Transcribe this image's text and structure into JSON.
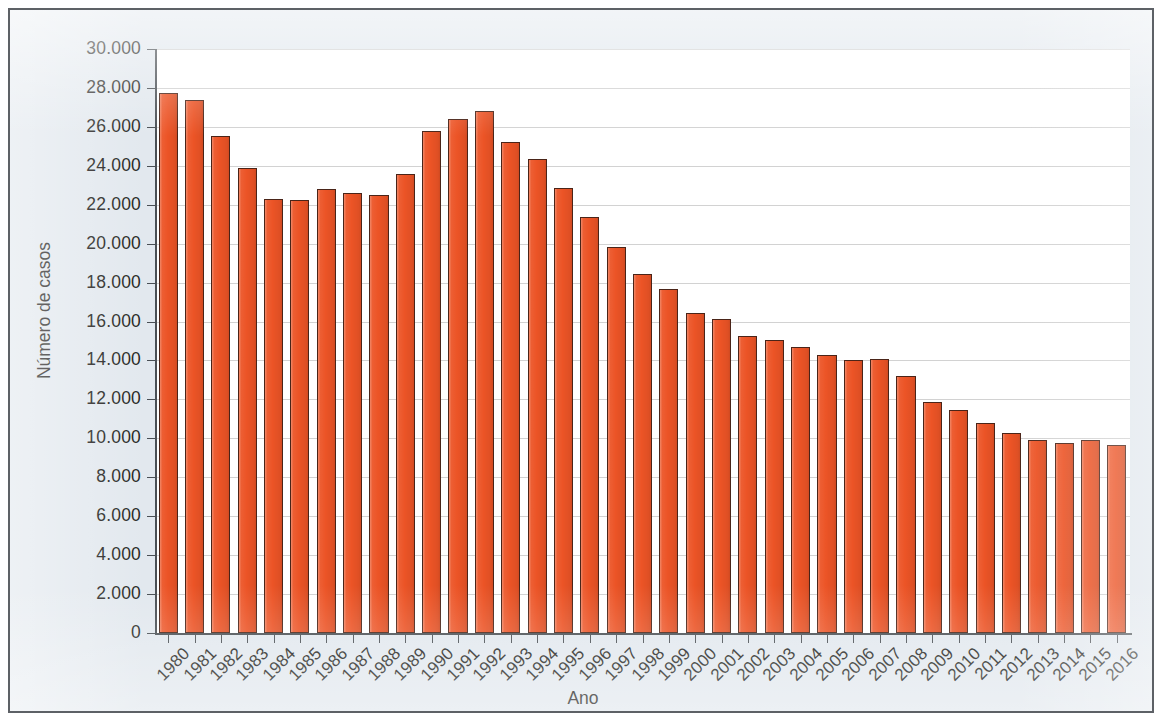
{
  "figure": {
    "background_color": "#e2e8ee",
    "plot_background_color": "#ffffff",
    "border_color": "#5d6166",
    "bar_color": "#ec5426",
    "bar_edge_color": "#4a2418",
    "gridline_color": "#d2d2d2",
    "axis_color": "#4a4f54",
    "text_color": "#231f20"
  },
  "chart_data": {
    "type": "bar",
    "title": "",
    "subtitle": "",
    "xlabel": "Ano",
    "ylabel": "Número de casos",
    "ylim": [
      0,
      30000
    ],
    "ytick_step": 2000,
    "grid": true,
    "legend": null,
    "legend_position": "none",
    "annotations": [],
    "ytick_labels": [
      "0",
      "2.000",
      "4.000",
      "6.000",
      "8.000",
      "10.000",
      "12.000",
      "14.000",
      "16.000",
      "18.000",
      "20.000",
      "22.000",
      "24.000",
      "26.000",
      "28.000",
      "30.000"
    ],
    "ytick_values": [
      0,
      2000,
      4000,
      6000,
      8000,
      10000,
      12000,
      14000,
      16000,
      18000,
      20000,
      22000,
      24000,
      26000,
      28000,
      30000
    ],
    "categories": [
      "1980",
      "1981",
      "1982",
      "1983",
      "1984",
      "1985",
      "1986",
      "1987",
      "1988",
      "1989",
      "1990",
      "1991",
      "1992",
      "1993",
      "1994",
      "1995",
      "1996",
      "1997",
      "1998",
      "1999",
      "2000",
      "2001",
      "2002",
      "2003",
      "2004",
      "2005",
      "2006",
      "2007",
      "2008",
      "2009",
      "2010",
      "2011",
      "2012",
      "2013",
      "2014",
      "2015",
      "2016"
    ],
    "values": [
      27750,
      27400,
      25550,
      23900,
      22300,
      22250,
      22800,
      22600,
      22500,
      23600,
      25800,
      26400,
      26800,
      25200,
      24350,
      22850,
      21350,
      19850,
      18450,
      17650,
      16450,
      16150,
      15250,
      15050,
      14700,
      14300,
      14000,
      14050,
      13200,
      11850,
      11450,
      10800,
      10250,
      9900,
      9750,
      9900,
      9650
    ]
  }
}
